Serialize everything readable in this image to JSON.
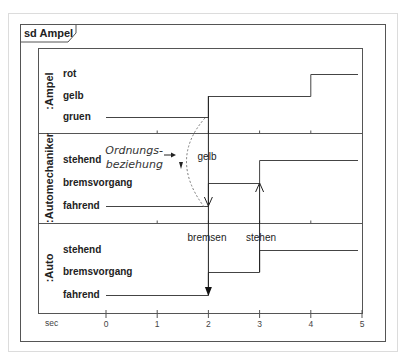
{
  "diagram": {
    "type": "UML timing diagram",
    "frame_label": "sd Ampel",
    "time_axis": {
      "unit_label": "sec",
      "ticks": [
        "0",
        "1",
        "2",
        "3",
        "4",
        "5"
      ],
      "range": [
        0,
        5
      ]
    },
    "lifelines": [
      {
        "name": ":Ampel",
        "states": [
          "rot",
          "gelb",
          "gruen"
        ],
        "timeline": [
          {
            "from": 0,
            "to": 2,
            "state": "gruen"
          },
          {
            "from": 2,
            "to": 4,
            "state": "gelb"
          },
          {
            "from": 4,
            "to": 5,
            "state": "rot"
          }
        ]
      },
      {
        "name": ":Automechaniker",
        "states": [
          "stehend",
          "bremsvorgang",
          "fahrend"
        ],
        "timeline": [
          {
            "from": 0,
            "to": 2,
            "state": "fahrend"
          },
          {
            "from": 2,
            "to": 3,
            "state": "bremsvorgang"
          },
          {
            "from": 3,
            "to": 5,
            "state": "stehend"
          }
        ]
      },
      {
        "name": ":Auto",
        "states": [
          "stehend",
          "bremsvorgang",
          "fahrend"
        ],
        "timeline": [
          {
            "from": 0,
            "to": 2,
            "state": "fahrend"
          },
          {
            "from": 2,
            "to": 3,
            "state": "bremsvorgang"
          },
          {
            "from": 3,
            "to": 5,
            "state": "stehend"
          }
        ]
      }
    ],
    "messages": [
      {
        "label": "gelb",
        "time": 2,
        "from": ":Ampel",
        "to": ":Automechaniker",
        "arrow": "open"
      },
      {
        "label": "bremsen",
        "time": 2,
        "from": ":Automechaniker",
        "to": ":Auto",
        "arrow": "filled"
      },
      {
        "label": "stehen",
        "time": 3,
        "from": ":Auto",
        "to": ":Automechaniker",
        "arrow": "open"
      }
    ],
    "annotation": {
      "line1": "Ordnungs-",
      "line2": "beziehung"
    }
  }
}
